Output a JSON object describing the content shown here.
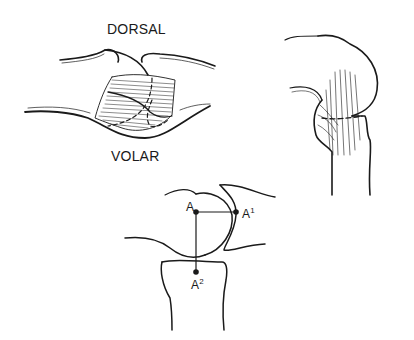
{
  "figure": {
    "panel_left": {
      "label_top": "DORSAL",
      "label_bottom": "VOLAR"
    },
    "panel_bottom": {
      "point_a": "A",
      "point_a1_base": "A",
      "point_a1_sup": "1",
      "point_a2_base": "A",
      "point_a2_sup": "2"
    }
  },
  "colors": {
    "ink": "#1a1a1a",
    "background": "#ffffff"
  }
}
